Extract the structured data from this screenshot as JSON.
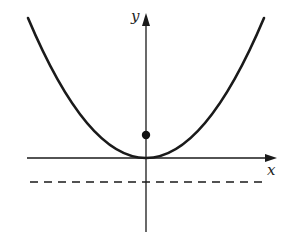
{
  "diagram": {
    "type": "parabola-focus-directrix",
    "labels": {
      "x_axis": "x",
      "y_axis": "y"
    },
    "colors": {
      "stroke": "#1a1a1a",
      "background": "#ffffff"
    },
    "geometry": {
      "origin_px": [
        146,
        158
      ],
      "parabola": {
        "left_end_px": [
          28,
          18
        ],
        "right_end_px": [
          264,
          18
        ],
        "vertex_px": [
          146,
          158
        ]
      },
      "focus_px": [
        146,
        135
      ],
      "directrix_y_px": 182,
      "x_axis": {
        "from_px": 27,
        "to_px": 276
      },
      "y_axis": {
        "from_px": 232,
        "to_px": 14
      }
    },
    "elements": [
      "parabola curve",
      "focus point",
      "directrix (dashed line)",
      "x-axis",
      "y-axis"
    ]
  }
}
